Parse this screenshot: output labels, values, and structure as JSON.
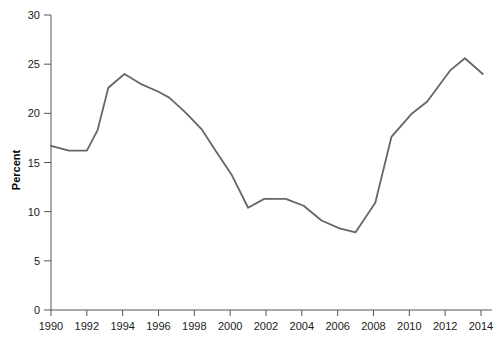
{
  "chart_data": {
    "type": "line",
    "title": "",
    "subtitle": "",
    "xlabel": "",
    "ylabel": "Percent",
    "xlim": [
      1989.5,
      2014.5
    ],
    "ylim": [
      0,
      30
    ],
    "grid": false,
    "legend": null,
    "line_color": "#666666",
    "axis_color": "#555555",
    "x": [
      1990,
      1991,
      1992,
      1993,
      1994,
      1995,
      1996,
      1997,
      1998,
      1999,
      2000,
      2001,
      2002,
      2003,
      2004,
      2005,
      2006,
      2007,
      2008,
      2009,
      2010,
      2011,
      2012,
      2013,
      2014
    ],
    "values": [
      16.7,
      16.2,
      16.2,
      18.3,
      22.6,
      24.0,
      23.0,
      22.2,
      20.7,
      18.8,
      15.7,
      13.7,
      10.4,
      11.3,
      11.3,
      10.7,
      9.1,
      8.3,
      7.9,
      10.9,
      17.6,
      19.8,
      21.2,
      24.5,
      25.6
    ],
    "series": [
      {
        "name": "Percent",
        "points": [
          {
            "x": 1990.0,
            "y": 16.7
          },
          {
            "x": 1991.0,
            "y": 16.2
          },
          {
            "x": 1992.0,
            "y": 16.2
          },
          {
            "x": 1992.6,
            "y": 18.3
          },
          {
            "x": 1993.2,
            "y": 22.6
          },
          {
            "x": 1994.1,
            "y": 24.0
          },
          {
            "x": 1995.0,
            "y": 23.0
          },
          {
            "x": 1996.0,
            "y": 22.2
          },
          {
            "x": 1996.6,
            "y": 21.6
          },
          {
            "x": 1997.5,
            "y": 20.1
          },
          {
            "x": 1998.4,
            "y": 18.4
          },
          {
            "x": 1999.3,
            "y": 15.9
          },
          {
            "x": 2000.1,
            "y": 13.7
          },
          {
            "x": 2001.0,
            "y": 10.4
          },
          {
            "x": 2001.9,
            "y": 11.3
          },
          {
            "x": 2003.1,
            "y": 11.3
          },
          {
            "x": 2004.1,
            "y": 10.6
          },
          {
            "x": 2005.1,
            "y": 9.1
          },
          {
            "x": 2006.1,
            "y": 8.3
          },
          {
            "x": 2007.0,
            "y": 7.9
          },
          {
            "x": 2008.1,
            "y": 10.9
          },
          {
            "x": 2009.0,
            "y": 17.6
          },
          {
            "x": 2010.1,
            "y": 19.9
          },
          {
            "x": 2011.0,
            "y": 21.2
          },
          {
            "x": 2012.3,
            "y": 24.4
          },
          {
            "x": 2013.1,
            "y": 25.6
          },
          {
            "x": 2014.1,
            "y": 24.0
          }
        ]
      }
    ],
    "y_ticks": [
      0,
      5,
      10,
      15,
      20,
      25,
      30
    ],
    "y_tick_labels": [
      "0",
      "5",
      "10",
      "15",
      "20",
      "25",
      "30"
    ],
    "x_ticks": [
      1990,
      1992,
      1994,
      1996,
      1998,
      2000,
      2002,
      2004,
      2006,
      2008,
      2010,
      2012,
      2014
    ],
    "x_tick_labels": [
      "1990",
      "1992",
      "1994",
      "1996",
      "1998",
      "2000",
      "2002",
      "2004",
      "2006",
      "2008",
      "2010",
      "2012",
      "2014"
    ],
    "x_minor_ticks": [
      1991,
      1993,
      1995,
      1997,
      1999,
      2001,
      2003,
      2005,
      2007,
      2009,
      2011,
      2013
    ],
    "annotations": []
  }
}
